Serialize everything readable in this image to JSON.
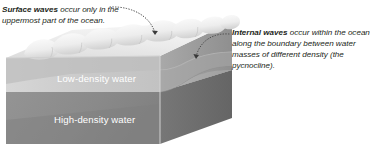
{
  "figure": {
    "type": "cutaway-block-diagram"
  },
  "callouts": {
    "left": {
      "term": "Surface waves",
      "text": " occur only in the uppermost part of the ocean.",
      "leader": "dotted-curved-arrow-to-wave-crest"
    },
    "right": {
      "term": "Internal waves",
      "text": " occur within the ocean along the boundary between water masses of different density (the pycnocline).",
      "leader": "dotted-curved-arrow-to-pycnocline"
    }
  },
  "labels": {
    "low_density": "Low-density water",
    "high_density": "High-density water"
  },
  "colors": {
    "text": "#231f20",
    "label_text": "#ffffff",
    "surface_wave_light": "#f2f2f2",
    "surface_wave_shade": "#d9d9d9",
    "low_density_front": "#cccccc",
    "low_density_side": "#9a9a9a",
    "high_density_front": "#8a8a8a",
    "high_density_side": "#6e6e6e",
    "leader_line": "#4d4d4d"
  }
}
